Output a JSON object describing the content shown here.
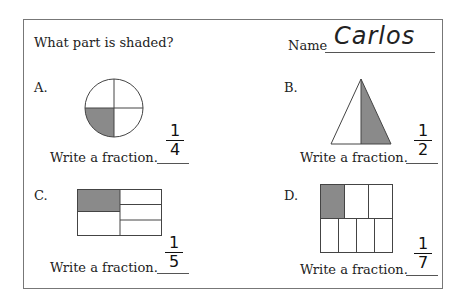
{
  "worksheet": {
    "title": "What part is shaded?",
    "name_label": "Name",
    "name_value": "Carlos",
    "problems": [
      {
        "letter": "A.",
        "shape": "circle",
        "parts": 4,
        "shaded": 1,
        "prompt": "Write a fraction.",
        "answer": {
          "numerator": "1",
          "denominator": "4"
        }
      },
      {
        "letter": "B.",
        "shape": "triangle",
        "parts": 2,
        "shaded": 1,
        "prompt": "Write a fraction.",
        "answer": {
          "numerator": "1",
          "denominator": "2"
        }
      },
      {
        "letter": "C.",
        "shape": "rectangle-unequal",
        "parts": 5,
        "shaded": 1,
        "prompt": "Write a fraction.",
        "answer": {
          "numerator": "1",
          "denominator": "5"
        }
      },
      {
        "letter": "D.",
        "shape": "rectangle-unequal",
        "parts": 7,
        "shaded": 1,
        "prompt": "Write a fraction.",
        "answer": {
          "numerator": "1",
          "denominator": "7"
        }
      }
    ],
    "colors": {
      "shade": "#8a8a8a",
      "stroke": "#444444",
      "border": "#777777"
    }
  }
}
